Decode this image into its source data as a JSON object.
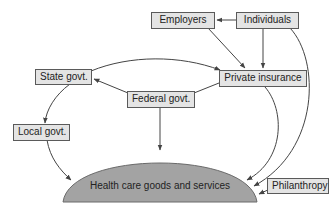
{
  "diagram": {
    "type": "flow-of-funds",
    "colors": {
      "box_fill": "#e4e4e4",
      "box_border": "#5a5a5a",
      "dome_fill": "#a3a3a3",
      "arrow": "#444444"
    },
    "nodes": {
      "employers": "Employers",
      "individuals": "Individuals",
      "state_govt": "State govt.",
      "private_insurance": "Private insurance",
      "federal_govt": "Federal govt.",
      "local_govt": "Local govt.",
      "philanthropy": "Philanthropy",
      "health_care": "Health care goods and services"
    },
    "edges": [
      {
        "from": "Individuals",
        "to": "Employers"
      },
      {
        "from": "Individuals",
        "to": "Private insurance"
      },
      {
        "from": "Employers",
        "to": "Private insurance"
      },
      {
        "from": "State govt.",
        "to": "Private insurance"
      },
      {
        "from": "Federal govt.",
        "to": "State govt."
      },
      {
        "from": "Federal govt.",
        "to": "Private insurance"
      },
      {
        "from": "State govt.",
        "to": "Local govt."
      },
      {
        "from": "Local govt.",
        "to": "Health care goods and services"
      },
      {
        "from": "Federal govt.",
        "to": "Health care goods and services"
      },
      {
        "from": "Private insurance",
        "to": "Health care goods and services"
      },
      {
        "from": "Individuals",
        "to": "Health care goods and services"
      },
      {
        "from": "Philanthropy",
        "to": "Health care goods and services"
      }
    ]
  }
}
